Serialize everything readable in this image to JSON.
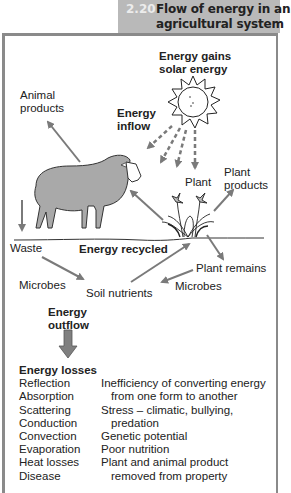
{
  "header": {
    "figure_number": "2.20",
    "title_line1": "Flow of energy in an",
    "title_line2": "agricultural system",
    "background_color": "#b9b9b9"
  },
  "diagram": {
    "energy_gains_line1": "Energy gains",
    "energy_gains_line2": "solar energy",
    "energy_inflow_line1": "Energy",
    "energy_inflow_line2": "inflow",
    "animal_products_line1": "Animal",
    "animal_products_line2": "products",
    "plant": "Plant",
    "plant_products_line1": "Plant",
    "plant_products_line2": "products",
    "waste": "Waste",
    "energy_recycled": "Energy recycled",
    "plant_remains": "Plant remains",
    "microbes_left": "Microbes",
    "soil_nutrients": "Soil nutrients",
    "microbes_right": "Microbes",
    "energy_outflow_line1": "Energy",
    "energy_outflow_line2": "outflow",
    "icons": [
      "sun-icon",
      "sheep-icon",
      "plant-icon",
      "arrow-icons"
    ],
    "arrow_color": "#7a7a7a"
  },
  "losses": {
    "title": "Energy losses",
    "rows": [
      {
        "physical": "Reflection",
        "biological": "Inefficiency of converting energy"
      },
      {
        "physical": "Absorption",
        "biological": "from one form to another"
      },
      {
        "physical": "Scattering",
        "biological": "Stress – climatic, bullying,"
      },
      {
        "physical": "Conduction",
        "biological": "predation"
      },
      {
        "physical": "Convection",
        "biological": "Genetic potential"
      },
      {
        "physical": "Evaporation",
        "biological": "Poor nutrition"
      },
      {
        "physical": "Heat losses",
        "biological": "Plant and animal product"
      },
      {
        "physical": "Disease",
        "biological": "removed from property"
      }
    ]
  }
}
